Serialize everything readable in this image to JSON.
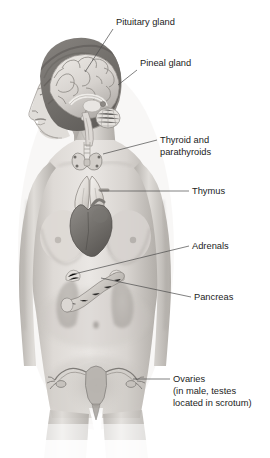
{
  "diagram": {
    "style": "grayscale medical illustration",
    "background_color": "#ffffff",
    "label_text_color": "#1c1c1c",
    "leader_line_color": "#4a4a4a",
    "skin_tone_light": "#e3e0dc",
    "skin_tone_mid": "#c6c2bd",
    "skin_tone_shadow": "#a6a29d",
    "organ_dark": "#6d6a67",
    "organ_mid": "#9a9793",
    "organ_light": "#d9d6d2"
  },
  "labels": [
    {
      "id": "pituitary-gland",
      "lines": [
        "Pituitary gland"
      ],
      "text_x": 116,
      "text_y": 25,
      "leader": "M113,29 L85,72"
    },
    {
      "id": "pineal-gland",
      "lines": [
        "Pineal gland"
      ],
      "text_x": 140,
      "text_y": 66,
      "leader": "M137,70 L118,85"
    },
    {
      "id": "thyroid-and-parathyroids",
      "lines": [
        "Thyroid and",
        "parathyroids"
      ],
      "text_x": 160,
      "text_y": 143,
      "leader": "M157,140 L103,154"
    },
    {
      "id": "thymus",
      "lines": [
        "Thymus"
      ],
      "text_x": 192,
      "text_y": 194,
      "leader": "M189,191 L100,191"
    },
    {
      "id": "adrenals",
      "lines": [
        "Adrenals"
      ],
      "text_x": 192,
      "text_y": 249,
      "leader": "M189,246 L74,274"
    },
    {
      "id": "pancreas",
      "lines": [
        "Pancreas"
      ],
      "text_x": 194,
      "text_y": 300,
      "leader": "M191,297 L101,278"
    },
    {
      "id": "ovaries",
      "lines": [
        "Ovaries",
        "(in male, testes",
        "located in scrotum)"
      ],
      "text_x": 173,
      "text_y": 382,
      "leader": "M170,379 L133,379"
    }
  ],
  "structures": [
    {
      "id": "head-profile",
      "name": "head in left profile"
    },
    {
      "id": "brain-sagittal",
      "name": "sagittal section of brain"
    },
    {
      "id": "cerebrum",
      "name": "cerebrum with gyri"
    },
    {
      "id": "cerebellum",
      "name": "cerebellum"
    },
    {
      "id": "brainstem",
      "name": "brainstem"
    },
    {
      "id": "pituitary",
      "name": "pituitary gland"
    },
    {
      "id": "pineal",
      "name": "pineal gland"
    },
    {
      "id": "thyroid",
      "name": "thyroid gland"
    },
    {
      "id": "parathyroids",
      "name": "parathyroid glands"
    },
    {
      "id": "thymus-organ",
      "name": "thymus"
    },
    {
      "id": "heart",
      "name": "heart"
    },
    {
      "id": "kidney-left",
      "name": "left kidney"
    },
    {
      "id": "kidney-right",
      "name": "right kidney"
    },
    {
      "id": "adrenal-left",
      "name": "left adrenal gland"
    },
    {
      "id": "adrenal-right",
      "name": "right adrenal gland"
    },
    {
      "id": "pancreas-organ",
      "name": "pancreas"
    },
    {
      "id": "uterus",
      "name": "uterus"
    },
    {
      "id": "fallopian-tubes",
      "name": "fallopian tubes"
    },
    {
      "id": "ovary-left",
      "name": "left ovary"
    },
    {
      "id": "ovary-right",
      "name": "right ovary"
    },
    {
      "id": "navel",
      "name": "navel"
    },
    {
      "id": "breasts",
      "name": "breasts"
    }
  ]
}
